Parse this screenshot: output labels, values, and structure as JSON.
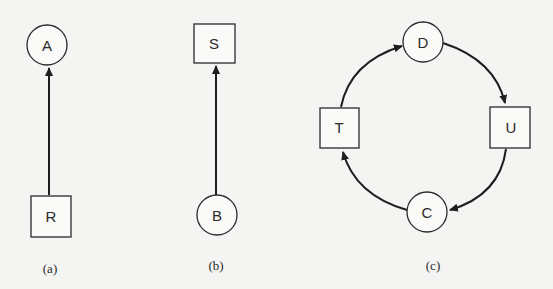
{
  "figures": [
    {
      "caption": "(a)",
      "nodes": [
        {
          "id": "A",
          "label": "A",
          "shape": "circle"
        },
        {
          "id": "R",
          "label": "R",
          "shape": "square"
        }
      ],
      "edges": [
        {
          "from": "R",
          "to": "A"
        }
      ]
    },
    {
      "caption": "(b)",
      "nodes": [
        {
          "id": "S",
          "label": "S",
          "shape": "square"
        },
        {
          "id": "B",
          "label": "B",
          "shape": "circle"
        }
      ],
      "edges": [
        {
          "from": "B",
          "to": "S"
        }
      ]
    },
    {
      "caption": "(c)",
      "nodes": [
        {
          "id": "D",
          "label": "D",
          "shape": "circle"
        },
        {
          "id": "U",
          "label": "U",
          "shape": "square"
        },
        {
          "id": "C",
          "label": "C",
          "shape": "circle"
        },
        {
          "id": "T",
          "label": "T",
          "shape": "square"
        }
      ],
      "edges": [
        {
          "from": "D",
          "to": "U"
        },
        {
          "from": "U",
          "to": "C"
        },
        {
          "from": "C",
          "to": "T"
        },
        {
          "from": "T",
          "to": "D"
        }
      ]
    }
  ],
  "colors": {
    "background": "#f4f4f2",
    "ink": "#1e1e1e"
  }
}
